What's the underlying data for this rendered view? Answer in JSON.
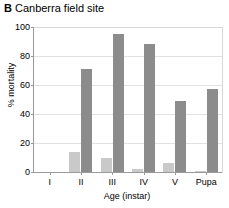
{
  "panel": {
    "letter": "B",
    "title": "Canberra field site"
  },
  "chart_data": {
    "type": "bar",
    "title": "Canberra field site",
    "panel_label": "B",
    "xlabel": "Age (instar)",
    "ylabel": "% mortality",
    "categories": [
      "I",
      "II",
      "III",
      "IV",
      "V",
      "Pupa"
    ],
    "ylim": [
      0,
      100
    ],
    "yticks": [
      0,
      20,
      40,
      60,
      80,
      100
    ],
    "grid": true,
    "legend": "none",
    "series": [
      {
        "name": "light",
        "color": "#c9c9c9",
        "values": [
          0,
          14,
          10,
          2,
          6,
          1
        ]
      },
      {
        "name": "dark",
        "color": "#8c8c8c",
        "values": [
          0,
          71,
          95,
          88,
          49,
          57
        ]
      }
    ]
  }
}
